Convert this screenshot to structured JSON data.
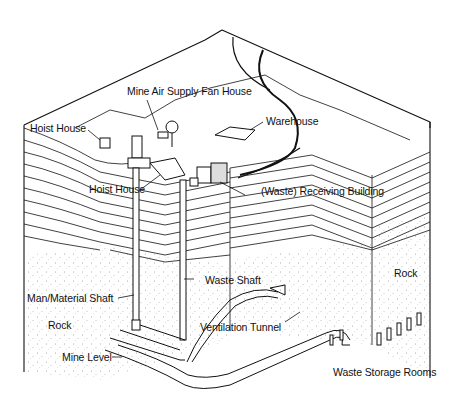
{
  "diagram": {
    "type": "cutaway-illustration",
    "labels": {
      "mine_air_supply_fan_house": "Mine Air Supply Fan House",
      "hoist_house_surface": "Hoist House",
      "warehouse": "Warehouse",
      "hoist_house_shaft": "Hoist House",
      "waste_receiving_building": "(Waste) Receiving Building",
      "waste_shaft": "Waste Shaft",
      "man_material_shaft": "Man/Material Shaft",
      "rock_left": "Rock",
      "rock_right": "Rock",
      "ventilation_tunnel": "Ventilation Tunnel",
      "mine_level": "Mine Level",
      "waste_storage_rooms": "Waste Storage Rooms"
    },
    "colors": {
      "ink": "#111111",
      "paper": "#ffffff"
    }
  }
}
